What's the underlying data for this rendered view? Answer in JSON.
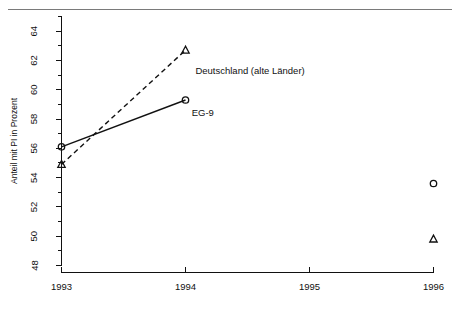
{
  "figure": {
    "header_rule": true,
    "ghost_header_text": "",
    "ghost_header_right": ""
  },
  "chart_data": {
    "type": "line",
    "title": "",
    "xlabel": "",
    "ylabel": "Anteil mit PI in Prozent",
    "xlim": [
      1993,
      1996
    ],
    "ylim": [
      48,
      65
    ],
    "grid": false,
    "legend": "inline-annotations",
    "x_ticks": [
      "1993",
      "1994",
      "1995",
      "1996"
    ],
    "x_tick_values": [
      1993,
      1994,
      1995,
      1996
    ],
    "y_ticks": [
      "48",
      "50",
      "52",
      "54",
      "56",
      "58",
      "60",
      "62",
      "64"
    ],
    "y_tick_values": [
      48,
      50,
      52,
      54,
      56,
      58,
      60,
      62,
      64
    ],
    "y_minor_ticks": [
      49,
      51,
      53,
      55,
      57,
      59,
      61,
      63,
      65
    ],
    "series": [
      {
        "name": "Deutschland (alte Länder)",
        "marker": "triangle",
        "line_style": "dashed",
        "label_x": 1994.08,
        "label_y": 61.1,
        "x": [
          1993,
          1994,
          1996
        ],
        "values": [
          54.9,
          62.7,
          49.8
        ],
        "connected_segments": [
          [
            1993,
            1994
          ]
        ]
      },
      {
        "name": "EG-9",
        "marker": "circle",
        "line_style": "solid",
        "label_x": 1994.05,
        "label_y": 58.2,
        "x": [
          1993,
          1994,
          1996
        ],
        "values": [
          56.1,
          59.3,
          53.6
        ],
        "connected_segments": [
          [
            1993,
            1994
          ]
        ]
      }
    ],
    "annotations": [
      {
        "text": "Deutschland (alte Länder)",
        "x": 1994.08,
        "y": 61.1
      },
      {
        "text": "EG-9",
        "x": 1994.05,
        "y": 58.2
      }
    ]
  }
}
